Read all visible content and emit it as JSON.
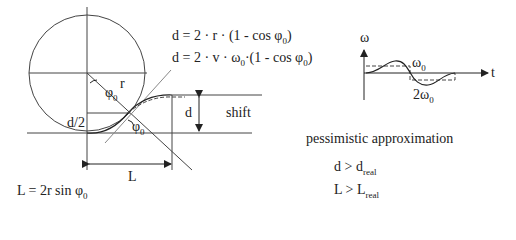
{
  "geometry": {
    "labels": {
      "r": "r",
      "phi0_top": "φ",
      "phi0_top_sub": "0",
      "d_half": "d/2",
      "phi0_bottom": "φ",
      "phi0_bottom_sub": "0",
      "d": "d",
      "shift": "shift",
      "L": "L"
    },
    "formula_L": {
      "main": "L = 2r sin φ",
      "sub": "0"
    }
  },
  "formulas": {
    "d_r": {
      "main": "d = 2 · r · (1 - cos φ",
      "sub": "0",
      "tail": ")"
    },
    "d_v": {
      "a": "d = 2 · v · ω",
      "sub1": "0",
      "b": "·(1 - cos φ",
      "sub2": "0",
      "tail": ")"
    }
  },
  "omega_plot": {
    "y_axis_label": "ω",
    "x_axis_label": "t",
    "level_label": {
      "main": "ω",
      "sub": "0"
    },
    "amp_label": {
      "main": "2ω",
      "sub": "0"
    }
  },
  "notes": {
    "title": "pessimistic approximation",
    "items": [
      {
        "main": "d > d",
        "sub": "real"
      },
      {
        "main": "L > L",
        "sub": "real"
      }
    ]
  }
}
